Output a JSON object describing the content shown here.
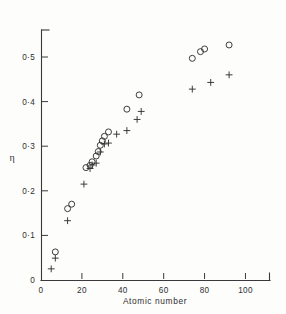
{
  "figure": {
    "background_color": "#fdfdfc",
    "ink_color": "#333333"
  },
  "axes": {
    "x_title": "Atomic number",
    "y_title": "η",
    "x_ticks": [
      "0",
      "20",
      "40",
      "60",
      "80",
      "100"
    ],
    "y_ticks": [
      "0",
      "0·1",
      "0·2",
      "0·3",
      "0·4",
      "0·5"
    ]
  },
  "chart_data": {
    "type": "scatter",
    "title": "",
    "xlabel": "Atomic number",
    "ylabel": "η",
    "xlim": [
      0,
      112
    ],
    "ylim": [
      0,
      0.575
    ],
    "xticks": [
      0,
      20,
      40,
      60,
      80,
      100
    ],
    "yticks": [
      0,
      0.1,
      0.2,
      0.3,
      0.4,
      0.5
    ],
    "grid": false,
    "legend": "none",
    "series": [
      {
        "name": "circles",
        "marker": "open-circle",
        "points": [
          [
            7,
            0.063
          ],
          [
            13,
            0.16
          ],
          [
            15,
            0.17
          ],
          [
            22,
            0.252
          ],
          [
            24,
            0.257
          ],
          [
            25,
            0.265
          ],
          [
            27,
            0.278
          ],
          [
            28,
            0.288
          ],
          [
            29,
            0.302
          ],
          [
            30,
            0.312
          ],
          [
            31,
            0.322
          ],
          [
            33,
            0.332
          ],
          [
            42,
            0.383
          ],
          [
            48,
            0.415
          ],
          [
            74,
            0.497
          ],
          [
            78,
            0.512
          ],
          [
            80,
            0.518
          ],
          [
            92,
            0.527
          ]
        ]
      },
      {
        "name": "plusses",
        "marker": "plus",
        "points": [
          [
            5,
            0.025
          ],
          [
            7,
            0.049
          ],
          [
            13,
            0.133
          ],
          [
            21,
            0.215
          ],
          [
            24,
            0.25
          ],
          [
            25,
            0.258
          ],
          [
            27,
            0.262
          ],
          [
            29,
            0.287
          ],
          [
            31,
            0.305
          ],
          [
            33,
            0.307
          ],
          [
            37,
            0.327
          ],
          [
            42,
            0.335
          ],
          [
            47,
            0.36
          ],
          [
            49,
            0.378
          ],
          [
            74,
            0.428
          ],
          [
            83,
            0.443
          ],
          [
            92,
            0.46
          ]
        ]
      }
    ]
  }
}
